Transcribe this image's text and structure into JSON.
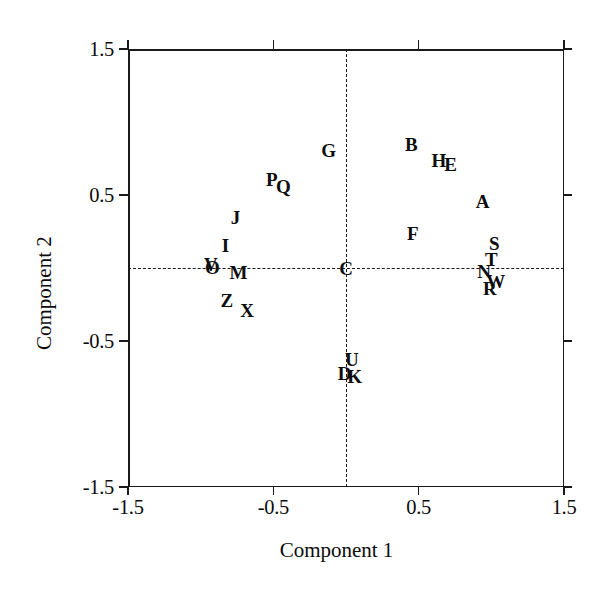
{
  "chart_data": {
    "type": "scatter",
    "title": "",
    "subtitle": "",
    "xlabel": "Component 1",
    "ylabel": "Component 2",
    "xlim": [
      -1.5,
      1.5
    ],
    "ylim": [
      -1.5,
      1.5
    ],
    "xticks": [
      "-1.5",
      "-0.5",
      "0.5",
      "1.5"
    ],
    "xtick_values": [
      -1.5,
      -0.5,
      0.5,
      1.5
    ],
    "yticks": [
      "-1.5",
      "-0.5",
      "0.5",
      "1.5"
    ],
    "ytick_values": [
      -1.5,
      -0.5,
      0.5,
      1.5
    ],
    "grid": false,
    "legend": "none",
    "marker_style": "text-label",
    "reference_lines": [
      {
        "orientation": "vertical",
        "value": 0,
        "style": "dashed"
      },
      {
        "orientation": "horizontal",
        "value": 0,
        "style": "dashed"
      }
    ],
    "points": [
      {
        "label": "G",
        "x": -0.12,
        "y": 0.81
      },
      {
        "label": "B",
        "x": 0.45,
        "y": 0.85
      },
      {
        "label": "H",
        "x": 0.64,
        "y": 0.74
      },
      {
        "label": "E",
        "x": 0.72,
        "y": 0.71
      },
      {
        "label": "P",
        "x": -0.51,
        "y": 0.61
      },
      {
        "label": "Q",
        "x": -0.43,
        "y": 0.56
      },
      {
        "label": "J",
        "x": -0.76,
        "y": 0.35
      },
      {
        "label": "A",
        "x": 0.94,
        "y": 0.46
      },
      {
        "label": "I",
        "x": -0.83,
        "y": 0.16
      },
      {
        "label": "F",
        "x": 0.46,
        "y": 0.24
      },
      {
        "label": "S",
        "x": 1.02,
        "y": 0.17
      },
      {
        "label": "T",
        "x": 1.0,
        "y": 0.06
      },
      {
        "label": "V",
        "x": -0.93,
        "y": 0.03
      },
      {
        "label": "O",
        "x": -0.92,
        "y": 0.01
      },
      {
        "label": "C",
        "x": 0.0,
        "y": 0.0
      },
      {
        "label": "N",
        "x": 0.95,
        "y": -0.02
      },
      {
        "label": "W",
        "x": 1.03,
        "y": -0.09
      },
      {
        "label": "M",
        "x": -0.74,
        "y": -0.03
      },
      {
        "label": "R",
        "x": 0.99,
        "y": -0.14
      },
      {
        "label": "Z",
        "x": -0.82,
        "y": -0.22
      },
      {
        "label": "X",
        "x": -0.68,
        "y": -0.29
      },
      {
        "label": "U",
        "x": 0.04,
        "y": -0.62
      },
      {
        "label": "D",
        "x": -0.01,
        "y": -0.72
      },
      {
        "label": "K",
        "x": 0.06,
        "y": -0.74
      }
    ]
  }
}
